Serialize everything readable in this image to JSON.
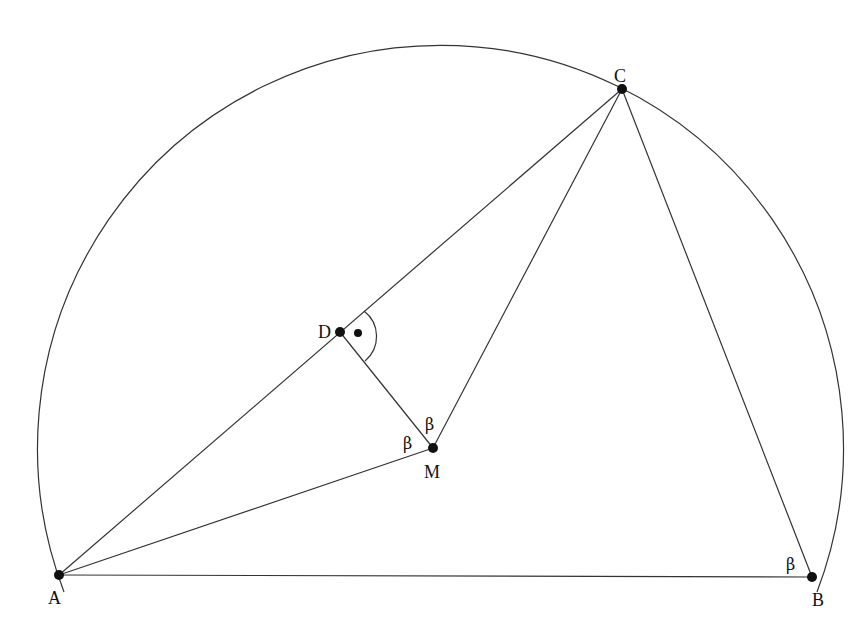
{
  "figure": {
    "points": {
      "A": {
        "label": "A",
        "x": 59,
        "y": 575
      },
      "B": {
        "label": "B",
        "x": 812,
        "y": 577
      },
      "C": {
        "label": "C",
        "x": 622,
        "y": 89
      },
      "D": {
        "label": "D",
        "x": 340,
        "y": 332
      },
      "M": {
        "label": "M",
        "x": 433,
        "y": 448
      }
    },
    "segments": [
      "AB",
      "AC",
      "BC",
      "AM",
      "CM",
      "DM"
    ],
    "arc": {
      "center": "M",
      "radius": 404
    },
    "angle_labels": [
      {
        "text": "β",
        "at": "angle DMC"
      },
      {
        "text": "β",
        "at": "angle AMD side near M"
      },
      {
        "text": "β",
        "at": "angle ABC"
      }
    ],
    "right_angle_marker": {
      "at": "D",
      "symbol": "•"
    }
  }
}
